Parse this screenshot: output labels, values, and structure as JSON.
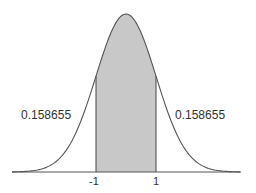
{
  "chart_data": {
    "type": "area",
    "title": "",
    "xlabel": "",
    "ylabel": "",
    "x_ticks": [
      "-1",
      "1"
    ],
    "shaded_interval": [
      -1,
      1
    ],
    "annotations": [
      {
        "text": "0.158655",
        "position": "left tail",
        "meaning": "P(X < -1)"
      },
      {
        "text": "0.158655",
        "position": "right tail",
        "meaning": "P(X > 1)"
      }
    ],
    "grid": false,
    "legend": null,
    "colors": {
      "shade": "#c8c8c8",
      "curve": "#555555",
      "axis": "#555555"
    }
  },
  "labels": {
    "left_tail": "0.158655",
    "right_tail": "0.158655",
    "tick_neg1": "-1",
    "tick_pos1": "1"
  }
}
